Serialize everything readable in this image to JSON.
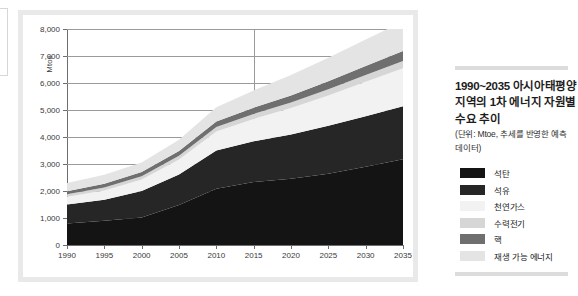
{
  "panel": {
    "title": "1990~2035 아시아태평양 지역의 1차 에너지 자원별 수요 추이",
    "subtitle": "(단위: Mtoe, 추세를 반영한 예측 데이터)"
  },
  "chart_data": {
    "type": "area",
    "stacked": true,
    "title": "1990~2035 아시아태평양 지역의 1차 에너지 자원별 수요 추이",
    "xlabel": "",
    "ylabel": "Mtoe",
    "ylim": [
      0,
      8000
    ],
    "ytick_step": 1000,
    "grid": true,
    "legend_position": "right",
    "x": [
      1990,
      1995,
      2000,
      2005,
      2010,
      2015,
      2020,
      2025,
      2030,
      2035
    ],
    "xtick_labels": [
      "1990",
      "1995",
      "2000",
      "2005",
      "2010",
      "2015",
      "2020",
      "2025",
      "2030",
      "2035"
    ],
    "ytick_labels": [
      "0",
      "1,000",
      "2,000",
      "3,000",
      "4,000",
      "5,000",
      "6,000",
      "7,000",
      "8,000"
    ],
    "series": [
      {
        "name": "석탄",
        "color": "#141414",
        "values": [
          800,
          900,
          1020,
          1480,
          2080,
          2330,
          2450,
          2640,
          2900,
          3180
        ]
      },
      {
        "name": "석유",
        "color": "#262626",
        "values": [
          700,
          780,
          980,
          1130,
          1420,
          1510,
          1640,
          1780,
          1870,
          1960
        ]
      },
      {
        "name": "천연가스",
        "color": "#f2f2f2",
        "values": [
          290,
          340,
          430,
          560,
          700,
          830,
          980,
          1120,
          1280,
          1410
        ]
      },
      {
        "name": "수력전기",
        "color": "#d6d6d6",
        "values": [
          90,
          110,
          120,
          140,
          170,
          185,
          205,
          225,
          245,
          265
        ]
      },
      {
        "name": "핵",
        "color": "#6f6f6f",
        "values": [
          110,
          140,
          150,
          170,
          200,
          230,
          265,
          300,
          335,
          370
        ]
      },
      {
        "name": "재생 가능 에너지",
        "color": "#e4e4e4",
        "values": [
          310,
          330,
          360,
          420,
          530,
          640,
          760,
          870,
          980,
          1095
        ]
      }
    ],
    "totals": [
      2300,
      2600,
      3060,
      3900,
      5100,
      5725,
      6300,
      6935,
      7610,
      8280
    ]
  },
  "legend": {
    "items": [
      {
        "label": "석탄",
        "color": "#141414"
      },
      {
        "label": "석유",
        "color": "#262626"
      },
      {
        "label": "천연가스",
        "color": "#f2f2f2"
      },
      {
        "label": "수력전기",
        "color": "#d6d6d6"
      },
      {
        "label": "핵",
        "color": "#6f6f6f"
      },
      {
        "label": "재생 가능 에너지",
        "color": "#e4e4e4"
      }
    ]
  },
  "icons": {
    "swatch": "color-swatch-icon"
  }
}
